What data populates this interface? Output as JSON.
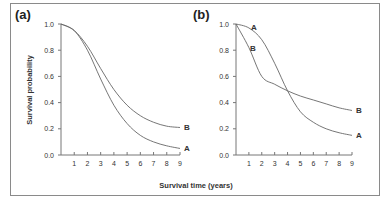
{
  "chart_data": [
    {
      "type": "line",
      "panel": "(a)",
      "xlabel": "Survival time (years)",
      "ylabel": "Survival probability",
      "xlim": [
        0,
        9
      ],
      "ylim": [
        0,
        1.0
      ],
      "x_ticks": [
        "1",
        "2",
        "3",
        "4",
        "5",
        "6",
        "7",
        "8",
        "9"
      ],
      "y_ticks": [
        "0.0",
        "0.2",
        "0.4",
        "0.6",
        "0.8",
        "1.0"
      ],
      "grid": false,
      "x": [
        0,
        1,
        2,
        3,
        4,
        5,
        6,
        7,
        8,
        9
      ],
      "series": [
        {
          "name": "A",
          "values": [
            1.0,
            0.95,
            0.8,
            0.58,
            0.38,
            0.24,
            0.15,
            0.1,
            0.07,
            0.05
          ]
        },
        {
          "name": "B",
          "values": [
            1.0,
            0.95,
            0.83,
            0.66,
            0.5,
            0.38,
            0.3,
            0.25,
            0.22,
            0.21
          ]
        }
      ]
    },
    {
      "type": "line",
      "panel": "(b)",
      "xlabel": "Survival time (years)",
      "ylabel": "Survival probability",
      "xlim": [
        0,
        9
      ],
      "ylim": [
        0,
        1.0
      ],
      "x_ticks": [
        "1",
        "2",
        "3",
        "4",
        "5",
        "6",
        "7",
        "8",
        "9"
      ],
      "y_ticks": [
        "0.0",
        "0.2",
        "0.4",
        "0.6",
        "0.8",
        "1.0"
      ],
      "grid": false,
      "x": [
        0,
        1,
        2,
        3,
        4,
        5,
        6,
        7,
        8,
        9
      ],
      "series": [
        {
          "name": "A",
          "values": [
            1.0,
            0.97,
            0.88,
            0.7,
            0.49,
            0.33,
            0.25,
            0.2,
            0.17,
            0.15
          ]
        },
        {
          "name": "B",
          "values": [
            1.0,
            0.82,
            0.6,
            0.54,
            0.49,
            0.45,
            0.42,
            0.39,
            0.36,
            0.34
          ]
        }
      ]
    }
  ],
  "figure": {
    "panel_a_label": "(a)",
    "panel_b_label": "(b)",
    "y_axis_title": "Survival probability",
    "x_axis_title": "Survival time (years)",
    "curve_labels": {
      "a": "A",
      "b": "B"
    }
  }
}
